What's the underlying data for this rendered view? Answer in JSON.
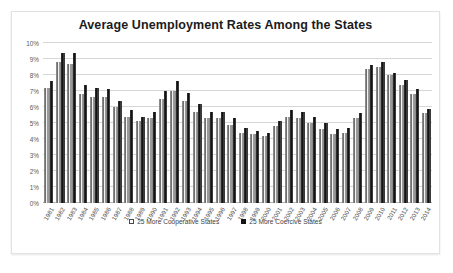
{
  "chart": {
    "title": "Average Unemployment Rates Among the States",
    "legend": [
      {
        "label": "25 More Cooperative States",
        "swatch": "hollow-square",
        "color": "#FFFFFF"
      },
      {
        "label": "25 More Coercive States",
        "swatch": "filled-square",
        "color": "#141414"
      }
    ]
  },
  "chart_data": {
    "type": "bar",
    "title": "Average Unemployment Rates Among the States",
    "xlabel": "",
    "ylabel": "",
    "ylim": [
      0,
      10
    ],
    "ytick_labels": [
      "10%",
      "9%",
      "8%",
      "7%",
      "6%",
      "5%",
      "4%",
      "3%",
      "2%",
      "1%",
      "0%"
    ],
    "ytick_values": [
      10,
      9,
      8,
      7,
      6,
      5,
      4,
      3,
      2,
      1,
      0
    ],
    "grid": true,
    "legend_position": "bottom",
    "unit": "percent",
    "categories": [
      "1981",
      "1982",
      "1983",
      "1984",
      "1985",
      "1986",
      "1987",
      "1988",
      "1989",
      "1990",
      "1991",
      "1992",
      "1993",
      "1994",
      "1995",
      "1996",
      "1997",
      "1998",
      "1999",
      "2000",
      "2001",
      "2002",
      "2003",
      "2004",
      "2005",
      "2006",
      "2007",
      "2008",
      "2009",
      "2010",
      "2011",
      "2012",
      "2013",
      "2014"
    ],
    "series": [
      {
        "name": "25 More Cooperative States",
        "color": "#F3F3F3",
        "values": [
          7.2,
          8.8,
          8.7,
          6.8,
          6.6,
          6.6,
          6.0,
          5.4,
          5.1,
          5.3,
          6.5,
          7.0,
          6.4,
          5.7,
          5.3,
          5.3,
          4.9,
          4.4,
          4.3,
          4.2,
          4.8,
          5.4,
          5.3,
          5.0,
          4.6,
          4.3,
          4.4,
          5.3,
          8.4,
          8.5,
          8.0,
          7.4,
          6.8,
          5.6
        ]
      },
      {
        "name": "25 More Coercive States",
        "color": "#141414",
        "values": [
          7.6,
          9.4,
          9.4,
          7.4,
          7.2,
          7.1,
          6.4,
          5.8,
          5.4,
          5.7,
          7.0,
          7.6,
          6.9,
          6.2,
          5.7,
          5.7,
          5.3,
          4.7,
          4.5,
          4.4,
          5.1,
          5.8,
          5.7,
          5.4,
          5.0,
          4.6,
          4.7,
          5.6,
          8.6,
          8.8,
          8.1,
          7.7,
          7.1,
          5.9
        ]
      }
    ]
  }
}
